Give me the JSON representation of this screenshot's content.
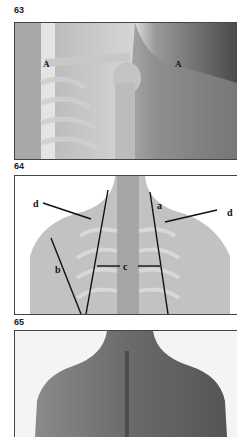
{
  "figures": [
    {
      "number": "63",
      "labels": [
        "A",
        "A"
      ]
    },
    {
      "number": "64",
      "labels": [
        "d",
        "a",
        "d",
        "b",
        "c"
      ]
    },
    {
      "number": "65",
      "labels": []
    }
  ]
}
